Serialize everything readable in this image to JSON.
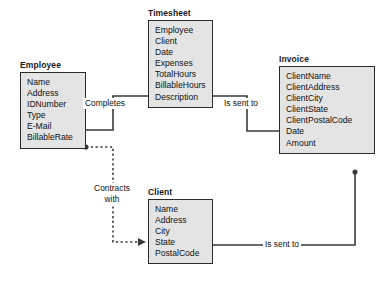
{
  "diagram": {
    "background_color": "#ffffff",
    "entity_fill_color": "#e4e4e4",
    "entity_border_color": "#2b2b2b",
    "connector_color": "#3a3a3a",
    "entities": [
      {
        "id": "employee",
        "name": "Employee",
        "attributes": [
          "Name",
          "Address",
          "IDNumber",
          "Type",
          "E-Mail",
          "BillableRate"
        ]
      },
      {
        "id": "timesheet",
        "name": "Timesheet",
        "attributes": [
          "Employee",
          "Client",
          "Date",
          "Expenses",
          "TotalHours",
          "BillableHours",
          "Description"
        ]
      },
      {
        "id": "invoice",
        "name": "Invoice",
        "attributes": [
          "ClientName",
          "ClientAddress",
          "ClientCity",
          "ClientState",
          "ClientPostalCode",
          "Date",
          "Amount"
        ]
      },
      {
        "id": "client",
        "name": "Client",
        "attributes": [
          "Name",
          "Address",
          "City",
          "State",
          "PostalCode"
        ]
      }
    ],
    "relationships": [
      {
        "id": "completes",
        "label": "Completes",
        "from": "employee",
        "to": "timesheet",
        "style": "solid"
      },
      {
        "id": "timesheet-to-invoice",
        "label": "Is sent to",
        "from": "timesheet",
        "to": "invoice",
        "style": "solid"
      },
      {
        "id": "contracts-with",
        "label_line1": "Contracts",
        "label_line2": "with",
        "from": "employee",
        "to": "client",
        "style": "dashed"
      },
      {
        "id": "client-to-invoice",
        "label": "Is sent to",
        "from": "client",
        "to": "invoice",
        "style": "solid"
      }
    ]
  }
}
